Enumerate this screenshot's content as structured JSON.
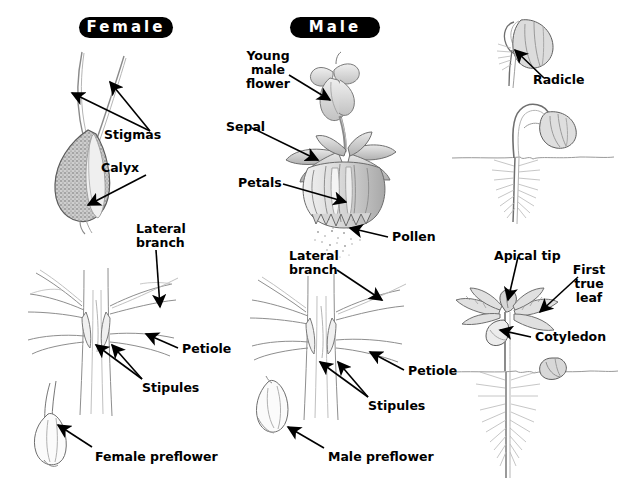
{
  "figure": {
    "background_color": "#ffffff",
    "ink_color": "#000000",
    "pencil_color": "#6e6e6e",
    "width": 621,
    "height": 483
  },
  "badges": [
    {
      "id": "female",
      "label": "Female",
      "x": 79,
      "y": 17,
      "w": 94,
      "h": 21
    },
    {
      "id": "male",
      "label": "Male",
      "x": 290,
      "y": 17,
      "w": 90,
      "h": 21
    }
  ],
  "columns": [
    {
      "id": "female-column",
      "heading": "Female",
      "panels": [
        {
          "id": "female-flower",
          "caption": "Mature female flower with stigmas and calyx",
          "labels": [
            "Stigmas",
            "Calyx"
          ]
        },
        {
          "id": "female-node",
          "caption": "Female node showing lateral branch, petiole and stipules",
          "labels": [
            "Lateral branch",
            "Petiole",
            "Stipules"
          ]
        },
        {
          "id": "female-preflower",
          "caption": "Female preflower",
          "labels": [
            "Female preflower"
          ]
        }
      ]
    },
    {
      "id": "male-column",
      "heading": "Male",
      "panels": [
        {
          "id": "male-flower",
          "caption": "Male flower cluster shedding pollen",
          "labels": [
            "Young male flower",
            "Sepal",
            "Petals",
            "Pollen"
          ]
        },
        {
          "id": "male-node",
          "caption": "Male node showing lateral branch, petiole and stipules",
          "labels": [
            "Lateral branch",
            "Petiole",
            "Stipules"
          ]
        },
        {
          "id": "male-preflower",
          "caption": "Male preflower",
          "labels": [
            "Male preflower"
          ]
        }
      ]
    },
    {
      "id": "seedling-column",
      "heading": "",
      "panels": [
        {
          "id": "germinating-seed",
          "caption": "Germinating seed emitting radicle",
          "labels": [
            "Radicle"
          ]
        },
        {
          "id": "sprout",
          "caption": "Sprout emerging above the soil line",
          "labels": []
        },
        {
          "id": "seedling",
          "caption": "Seedling with apical tip, first true leaf and cotyledon",
          "labels": [
            "Apical tip",
            "First true leaf",
            "Cotyledon"
          ]
        }
      ]
    }
  ],
  "labels": {
    "stigmas": "Stigmas",
    "calyx": "Calyx",
    "lateral_branch_left_1": "Lateral",
    "lateral_branch_left_2": "branch",
    "petiole_left": "Petiole",
    "stipules_left": "Stipules",
    "female_preflower": "Female preflower",
    "young_male_flower_1": "Young",
    "young_male_flower_2": "male",
    "young_male_flower_3": "flower",
    "sepal": "Sepal",
    "petals": "Petals",
    "pollen": "Pollen",
    "lateral_branch_mid_1": "Lateral",
    "lateral_branch_mid_2": "branch",
    "petiole_mid": "Petiole",
    "stipules_mid": "Stipules",
    "male_preflower": "Male preflower",
    "radicle": "Radicle",
    "apical_tip": "Apical tip",
    "first_true_leaf_1": "First",
    "first_true_leaf_2": "true",
    "first_true_leaf_3": "leaf",
    "cotyledon": "Cotyledon"
  }
}
